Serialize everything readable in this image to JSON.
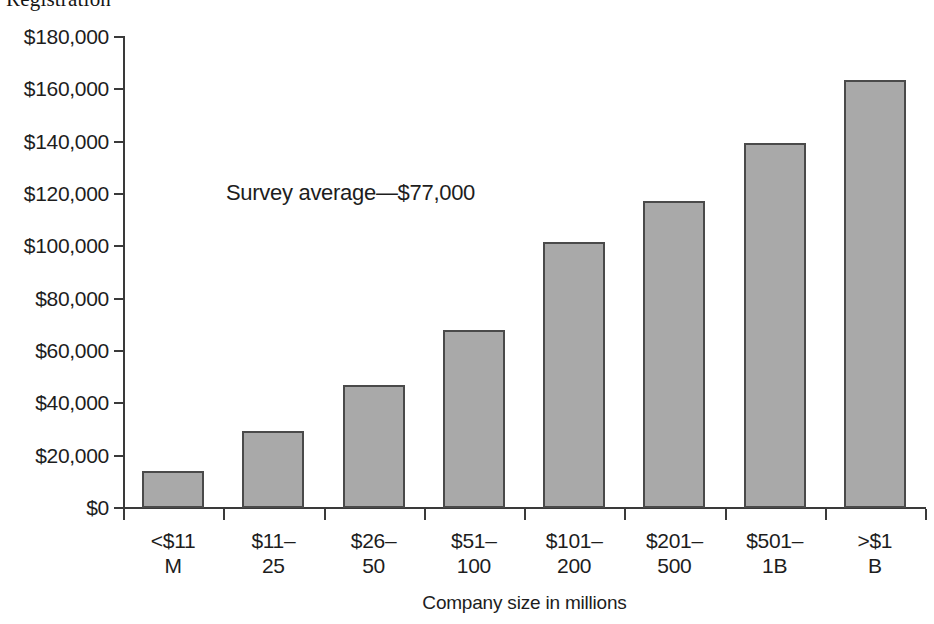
{
  "document": {
    "cropped_heading": "Registration"
  },
  "annotation": {
    "survey_average_text": "Survey average—$77,000"
  },
  "axis": {
    "x_title": "Company size in millions"
  },
  "colors": {
    "bar_fill": "#a9a9a9",
    "bar_border": "#4a4a4a",
    "axis": "#3a3a3a",
    "text": "#1d1d1d",
    "background": "#ffffff"
  },
  "chart_data": {
    "type": "bar",
    "title": "",
    "xlabel": "Company size in millions",
    "ylabel": "",
    "ylim": [
      0,
      180000
    ],
    "ytick_step": 20000,
    "grid": false,
    "legend": null,
    "categories": [
      "<$11 M",
      "$11–25",
      "$26–50",
      "$51–100",
      "$101–200",
      "$201–500",
      "$501–1B",
      ">$1 B"
    ],
    "category_lines": [
      [
        "<$11",
        "M"
      ],
      [
        "$11–",
        "25"
      ],
      [
        "$26–",
        "50"
      ],
      [
        "$51–",
        "100"
      ],
      [
        "$101–",
        "200"
      ],
      [
        "$201–",
        "500"
      ],
      [
        "$501–",
        "1B"
      ],
      [
        ">$1",
        "B"
      ]
    ],
    "values": [
      14000,
      29500,
      47000,
      68000,
      101500,
      117500,
      139500,
      163500
    ],
    "ytick_labels": [
      "$180,000",
      "$160,000",
      "$140,000",
      "$120,000",
      "$100,000",
      "$80,000",
      "$60,000",
      "$40,000",
      "$20,000",
      "$0"
    ],
    "ytick_values": [
      180000,
      160000,
      140000,
      120000,
      100000,
      80000,
      60000,
      40000,
      20000,
      0
    ],
    "annotations": [
      {
        "text": "Survey average—$77,000",
        "value": 77000
      }
    ]
  }
}
